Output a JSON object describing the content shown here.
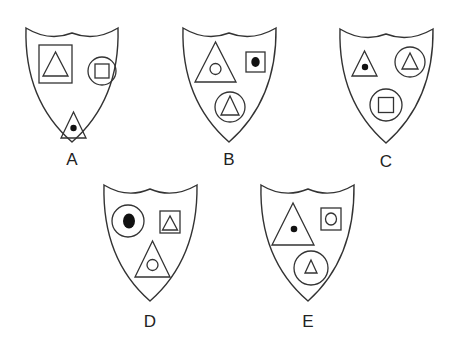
{
  "figure": {
    "type": "odd-one-out shield puzzle",
    "stroke_color": "#333333",
    "fill_dot_color": "#111111",
    "background": "#ffffff"
  },
  "options": [
    {
      "label": "A",
      "elements": [
        {
          "outer": "square",
          "inner": "triangle (outline)",
          "position": "top-left"
        },
        {
          "outer": "circle",
          "inner": "square (outline)",
          "position": "top-right"
        },
        {
          "outer": "triangle",
          "inner": "dot (filled)",
          "position": "bottom-center"
        }
      ]
    },
    {
      "label": "B",
      "elements": [
        {
          "outer": "triangle",
          "inner": "circle (outline)",
          "position": "top-left"
        },
        {
          "outer": "square",
          "inner": "dot (filled)",
          "position": "top-right"
        },
        {
          "outer": "circle",
          "inner": "triangle (outline)",
          "position": "bottom-center"
        }
      ]
    },
    {
      "label": "C",
      "elements": [
        {
          "outer": "triangle",
          "inner": "dot (filled)",
          "position": "top-left"
        },
        {
          "outer": "circle",
          "inner": "triangle (outline)",
          "position": "top-right"
        },
        {
          "outer": "circle",
          "inner": "square (outline)",
          "position": "bottom-center"
        }
      ]
    },
    {
      "label": "D",
      "elements": [
        {
          "outer": "circle",
          "inner": "dot (filled, large)",
          "position": "top-left"
        },
        {
          "outer": "square",
          "inner": "triangle (outline)",
          "position": "top-right"
        },
        {
          "outer": "triangle",
          "inner": "circle (outline)",
          "position": "bottom-center"
        }
      ]
    },
    {
      "label": "E",
      "elements": [
        {
          "outer": "triangle",
          "inner": "dot (filled)",
          "position": "top-left"
        },
        {
          "outer": "square",
          "inner": "circle (outline)",
          "position": "top-right"
        },
        {
          "outer": "circle",
          "inner": "triangle (outline)",
          "position": "bottom-center"
        }
      ]
    }
  ]
}
